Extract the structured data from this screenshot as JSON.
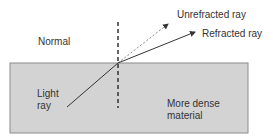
{
  "diagram": {
    "colors": {
      "background": "#ffffff",
      "material_fill": "#d3d3d3",
      "material_border": "#8c8c8c",
      "ray": "#333333",
      "unrefracted_ray": "#888888",
      "normal": "#333333",
      "text": "#333333"
    },
    "labels": {
      "normal": "Normal",
      "unrefracted": "Unrefracted ray",
      "refracted": "Refracted ray",
      "light_line1": "Light",
      "light_line2": "ray",
      "material_line1": "More dense",
      "material_line2": "material"
    },
    "geometry": {
      "material_box": {
        "x": 10,
        "y": 63,
        "w": 238,
        "h": 70
      },
      "incidence_point": {
        "x": 118,
        "y": 63
      },
      "light_ray_start": {
        "x": 67,
        "y": 107
      },
      "unrefracted_tip": {
        "x": 169,
        "y": 23
      },
      "refracted_tip": {
        "x": 196,
        "y": 32
      },
      "normal_line": {
        "x": 118,
        "y1": 22,
        "y2": 108
      }
    }
  }
}
